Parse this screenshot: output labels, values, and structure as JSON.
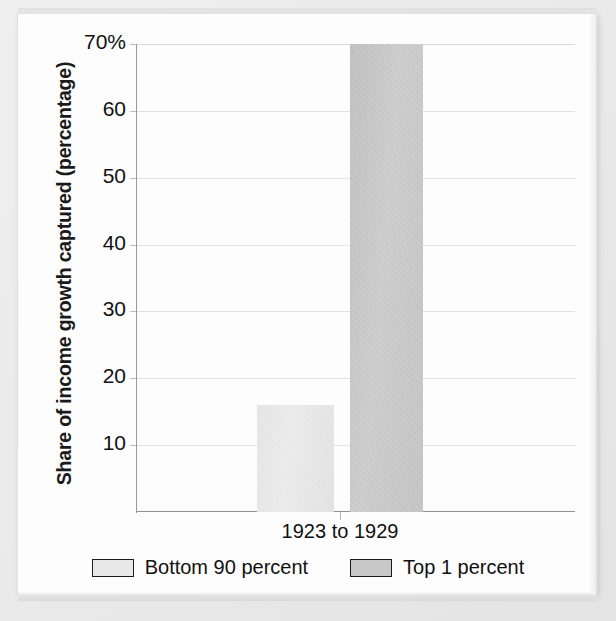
{
  "chart_data": {
    "type": "bar",
    "title": "",
    "subtitle": "",
    "xlabel": "",
    "ylabel": "Share of income growth captured (percentage)",
    "categories": [
      "1923 to 1929"
    ],
    "series": [
      {
        "name": "Bottom 90 percent",
        "values": [
          16
        ],
        "color": "#e8e8e8"
      },
      {
        "name": "Top 1 percent",
        "values": [
          70
        ],
        "color": "#c8c8c8"
      }
    ],
    "ylim": [
      0,
      70
    ],
    "yticks": [
      10,
      20,
      30,
      40,
      50,
      60,
      70
    ],
    "ytick_labels": [
      "10",
      "20",
      "30",
      "40",
      "50",
      "60",
      "70%"
    ],
    "grid": true,
    "legend_position": "bottom-center",
    "annotations": []
  },
  "axis": {
    "y_title": "Share of income growth captured (percentage)",
    "x_category_label": "1923 to 1929"
  },
  "legend": {
    "items": [
      {
        "label": "Bottom 90 percent",
        "swatch_color": "#e8e8e8"
      },
      {
        "label": "Top 1 percent",
        "swatch_color": "#c8c8c8"
      }
    ]
  },
  "colors": {
    "page_background": "#fdfdfd",
    "outer_background": "#e9e9e9",
    "gridline": "#e2e2e2",
    "axis_line": "#9a9a9a",
    "text": "#111111",
    "bar_light": "#e8e8e8",
    "bar_dark": "#c8c8c8"
  }
}
